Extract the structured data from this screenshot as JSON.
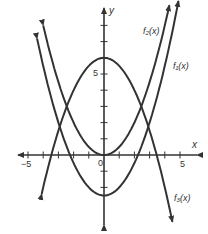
{
  "chart_data": {
    "type": "line",
    "title": "",
    "xlabel": "x",
    "ylabel": "y",
    "xlim": [
      -5.5,
      6.5
    ],
    "ylim": [
      -4,
      9.5
    ],
    "grid": false,
    "x_ticks": [
      -5,
      -4,
      -3,
      -2,
      -1,
      0,
      1,
      2,
      3,
      4,
      5
    ],
    "y_ticks": [
      -2,
      -1,
      0,
      1,
      2,
      3,
      4,
      5,
      6,
      7,
      8
    ],
    "tick_labels": {
      "x_neg": "−5",
      "x_pos": "5",
      "origin": "0",
      "y_pos": "5"
    },
    "series": [
      {
        "name": "f₁(x)",
        "label": "f₁(x)",
        "formula": "0.5x^2 - 2.5",
        "vertex": [
          0,
          -2.5
        ],
        "x_range": [
          -4.4,
          4.9
        ]
      },
      {
        "name": "f₂(x)",
        "label": "f₂(x)",
        "formula": "0.5x^2",
        "vertex": [
          0,
          0
        ],
        "x_range": [
          -4.0,
          4.3
        ]
      },
      {
        "name": "f₃(x)",
        "label": "f₃(x)",
        "formula": "6 - 0.5x^2",
        "vertex": [
          0,
          6
        ],
        "x_range": [
          -4.1,
          4.5
        ]
      }
    ]
  },
  "labels": {
    "x_axis": "x",
    "y_axis": "y",
    "x_neg5": "−5",
    "x_pos5": "5",
    "origin": "0",
    "y_pos5": "5",
    "f1": "f₁(x)",
    "f2": "f₂(x)",
    "f3": "f₃(x)"
  }
}
